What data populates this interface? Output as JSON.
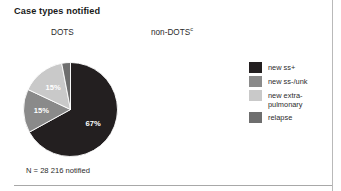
{
  "figure": {
    "title": "Case types notified",
    "columns": {
      "left": "DOTS",
      "right": "non-DOTS",
      "right_superscript": "c"
    },
    "caption": "N = 28 216 notified"
  },
  "legend": {
    "items": [
      {
        "label": "new ss+",
        "color": "#231f20"
      },
      {
        "label": "new ss-/unk",
        "color": "#8a8a8a"
      },
      {
        "label": "new extra-\npulmonary",
        "color": "#c9c9c9"
      },
      {
        "label": "relapse",
        "color": "#6e6e6e"
      }
    ]
  },
  "chart_data": {
    "type": "pie",
    "title": "Case types notified",
    "subtitle": "DOTS",
    "note": "N = 28 216 notified",
    "total_label": "N = 28 216 notified",
    "total": 28216,
    "legend_position": "right",
    "categories": [
      "new ss+",
      "new ss-/unk",
      "new extra-pulmonary",
      "relapse"
    ],
    "values": [
      67,
      15,
      15,
      3
    ],
    "value_labels": [
      "67%",
      "15%",
      "15%",
      "3%"
    ],
    "colors": [
      "#231f20",
      "#8a8a8a",
      "#c9c9c9",
      "#6e6e6e"
    ],
    "units": "percent"
  }
}
